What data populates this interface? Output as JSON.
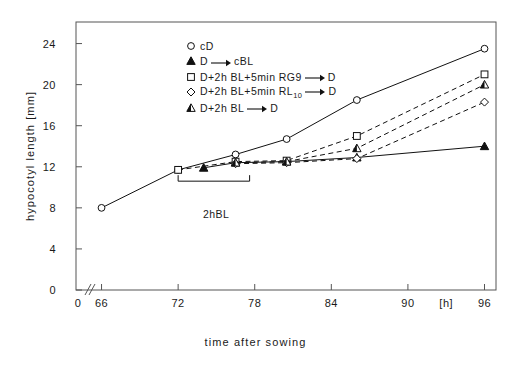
{
  "axes": {
    "ylabel": "hypocotyl length [mm]",
    "xlabel": "time after sowing",
    "xunit": "[h]",
    "yticks": [
      "0",
      "4",
      "8",
      "12",
      "16",
      "20",
      "24"
    ],
    "xticks": [
      "0",
      "66",
      "72",
      "78",
      "84",
      "90",
      "96"
    ]
  },
  "annotation": {
    "bl_label": "2hBL"
  },
  "legend": {
    "items": [
      {
        "marker": "open-circle",
        "text": "cD",
        "suffix": ""
      },
      {
        "marker": "filled-triangle",
        "text": "D",
        "arrow": true,
        "suffix": "cBL"
      },
      {
        "marker": "open-square",
        "text": "D+2h BL+5min RG9",
        "arrow": true,
        "suffix": "D"
      },
      {
        "marker": "open-diamond",
        "text": "D+2h BL+5min RL",
        "sub": "10",
        "arrow": true,
        "suffix": "D"
      },
      {
        "marker": "half-triangle",
        "text": "D+2h BL",
        "arrow": true,
        "suffix": "D"
      }
    ]
  },
  "chart_data": {
    "type": "line",
    "title": "",
    "xlabel": "time after sowing",
    "ylabel": "hypocotyl length [mm]",
    "xlim": [
      64,
      96
    ],
    "ylim": [
      0,
      26
    ],
    "xticks": [
      0,
      66,
      72,
      78,
      84,
      90,
      96
    ],
    "yticks": [
      0,
      4,
      8,
      12,
      16,
      20,
      24
    ],
    "xunit": "h",
    "yunit": "mm",
    "grid": false,
    "axis_break": "x-axis broken between 0 and 64",
    "legend_position": "top-center",
    "annotations": [
      {
        "label": "2hBL",
        "x_start": 72,
        "x_end": 74,
        "y": 10.6,
        "description": "bracket marking the 2 hour blue-light treatment window"
      }
    ],
    "series": [
      {
        "name": "cD",
        "marker": "open-circle",
        "linestyle": "solid",
        "x": [
          66,
          72,
          76.5,
          80.5,
          86,
          96
        ],
        "y": [
          8.0,
          11.7,
          13.2,
          14.7,
          18.5,
          23.5
        ]
      },
      {
        "name": "D → cBL",
        "marker": "filled-triangle",
        "linestyle": "solid",
        "x": [
          74,
          76.5,
          80.5,
          86,
          96
        ],
        "y": [
          11.9,
          12.4,
          12.5,
          12.9,
          14.0
        ]
      },
      {
        "name": "D+2h BL+5min RG9 → D",
        "marker": "open-square",
        "linestyle": "dashed",
        "x": [
          72,
          76.5,
          80.5,
          86,
          96
        ],
        "y": [
          11.7,
          12.5,
          12.6,
          15.0,
          21.0
        ]
      },
      {
        "name": "D+2h BL+5min RL10 → D",
        "marker": "open-diamond",
        "linestyle": "dashed",
        "x": [
          76.5,
          80.5,
          86,
          96
        ],
        "y": [
          12.3,
          12.4,
          12.8,
          18.3
        ]
      },
      {
        "name": "D+2h BL → D",
        "marker": "half-triangle",
        "linestyle": "dashed",
        "x": [
          76.5,
          80.5,
          86,
          96
        ],
        "y": [
          12.4,
          12.5,
          13.8,
          20.0
        ]
      }
    ]
  }
}
